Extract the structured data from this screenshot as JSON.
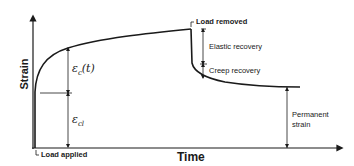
{
  "diagram": {
    "axes": {
      "x_label": "Time",
      "y_label": "Strain"
    },
    "annotations": {
      "load_applied": "Load applied",
      "load_removed": "Load removed",
      "elastic_recovery": "Elastic recovery",
      "creep_recovery": "Creep recovery",
      "permanent_strain_line1": "Permanent",
      "permanent_strain_line2": "strain",
      "creep_strain_symbol": "εc(t)",
      "creep_strain_base": "ε",
      "creep_strain_sub": "c",
      "creep_strain_arg": "(t)",
      "elastic_strain_base": "ε",
      "elastic_strain_sub": "cl"
    },
    "colors": {
      "line": "#1a1a1a",
      "background": "#ffffff"
    }
  }
}
